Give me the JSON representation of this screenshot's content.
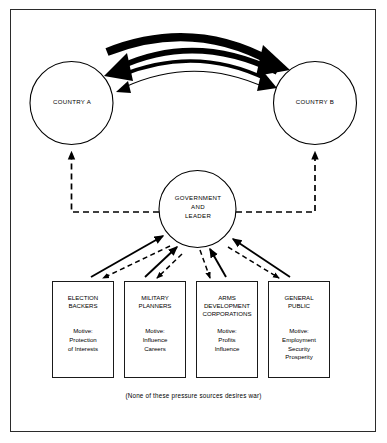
{
  "figure": {
    "caption": "(None of these pressure sources desires war)",
    "border_color": "#2b2b2b",
    "ink_color": "#000000",
    "background": "#ffffff"
  },
  "nodes": {
    "country_a": {
      "label": "COUNTRY A"
    },
    "country_b": {
      "label": "COUNTRY B"
    },
    "government": {
      "label": "GOVERNMENT\nAND\nLEADER"
    }
  },
  "pressure_sources": [
    {
      "id": "election-backers",
      "title": "ELECTION\nBACKERS",
      "motive": "Motive:\nProtection\nof Interests"
    },
    {
      "id": "military-planners",
      "title": "MILITARY\nPLANNERS",
      "motive": "Motive:\nInfluence\nCareers"
    },
    {
      "id": "arms-development-corporations",
      "title": "ARMS\nDEVELOPMENT\nCORPORATIONS",
      "motive": "Motive:\nProfits\nInfluence"
    },
    {
      "id": "general-public",
      "title": "GENERAL\nPUBLIC",
      "motive": "Motive:\nEmployment\nSecurity\nProsperity"
    }
  ],
  "connections": {
    "escalation_arrows": [
      {
        "direction": "a-to-b",
        "weight": "thickest"
      },
      {
        "direction": "b-to-a",
        "weight": "thick"
      },
      {
        "direction": "a-to-b",
        "weight": "medium"
      },
      {
        "direction": "b-to-a",
        "weight": "thin"
      }
    ],
    "government_to_countries": "dashed",
    "sources_to_government": "solid-up-dashed-down"
  }
}
